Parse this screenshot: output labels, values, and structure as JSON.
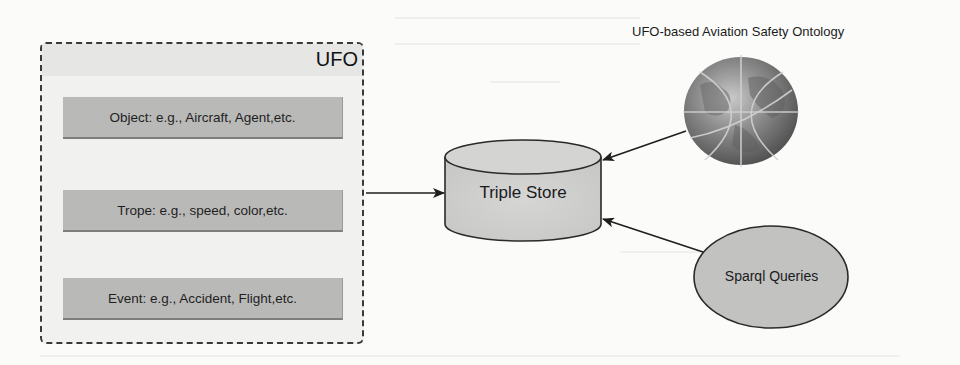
{
  "diagram": {
    "ufo_container": {
      "title": "UFO",
      "concepts": [
        {
          "label": "Object: e.g., Aircraft, Agent,etc."
        },
        {
          "label": "Trope: e.g., speed, color,etc."
        },
        {
          "label": "Event: e.g., Accident, Flight,etc."
        }
      ]
    },
    "triple_store": {
      "label": "Triple Store"
    },
    "ontology": {
      "title": "UFO-based Aviation Safety Ontology",
      "icon": "globe-icon"
    },
    "sparql": {
      "label": "Sparql Queries"
    },
    "edges": [
      {
        "from": "UFO",
        "to": "Triple Store"
      },
      {
        "from": "UFO-based Aviation Safety Ontology",
        "to": "Triple Store"
      },
      {
        "from": "Sparql Queries",
        "to": "Triple Store"
      }
    ],
    "colors": {
      "box_fill": "#b9b9b8",
      "container_fill": "#f1f1f0",
      "cylinder_fill": "#cfcfce",
      "ellipse_fill": "#c2c2c1",
      "stroke": "#2a2a2a"
    }
  }
}
